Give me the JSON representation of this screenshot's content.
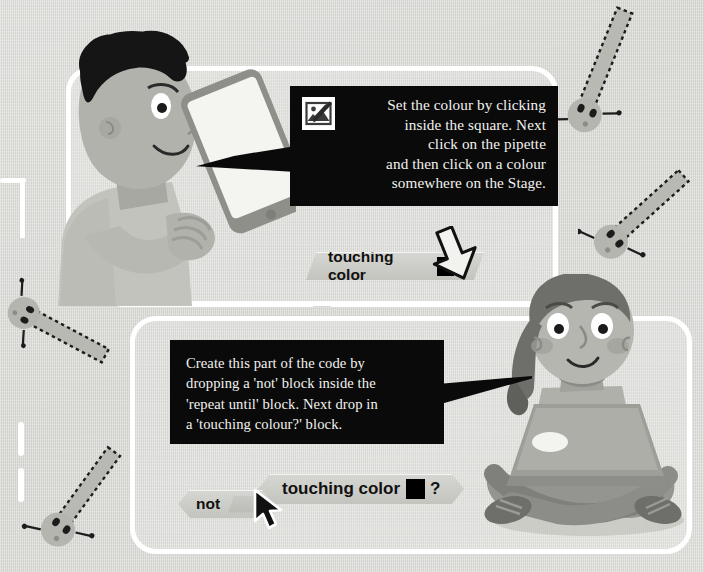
{
  "page": {
    "background_color": "#d9d9d6",
    "panel_border_color": "#ffffff",
    "callout_bg_color": "#0a0a0a",
    "callout_text_color": "#f2f2ef",
    "block_color": "#cbcbc6",
    "swatch_color": "#000000"
  },
  "top_panel": {
    "callout": {
      "line1": "Set the colour by clicking",
      "line2": "inside the square. Next",
      "line3": "click on the pipette",
      "line4": "and then click on a colour",
      "line5": "somewhere on the Stage.",
      "icon": "pipette-icon"
    },
    "block": {
      "label": "touching color",
      "swatch_value": "#000000",
      "question_mark": "?"
    },
    "character": "boy-with-tablet",
    "cursor": "hand-pointer-down"
  },
  "bottom_panel": {
    "callout": {
      "line1": "Create this part of the code by",
      "line2": "dropping a 'not' block inside the",
      "line3": "'repeat until' block. Next drop in",
      "line4": "a 'touching colour?' block."
    },
    "blocks": {
      "touching": {
        "label": "touching color",
        "swatch_value": "#000000",
        "question_mark": "?"
      },
      "not": {
        "label": "not",
        "slot_value": ""
      }
    },
    "character": "girl-with-laptop",
    "cursor": "arrow-pointer"
  },
  "decorations": {
    "microbes": [
      {
        "name": "microbe-top-right",
        "x": 560,
        "y": 10,
        "angle": 24
      },
      {
        "name": "microbe-right-upper",
        "x": 582,
        "y": 168,
        "angle": 44
      },
      {
        "name": "microbe-left-middle",
        "x": -10,
        "y": 286,
        "angle": 26
      },
      {
        "name": "microbe-bottom-left",
        "x": 28,
        "y": 452,
        "angle": 34
      }
    ]
  }
}
